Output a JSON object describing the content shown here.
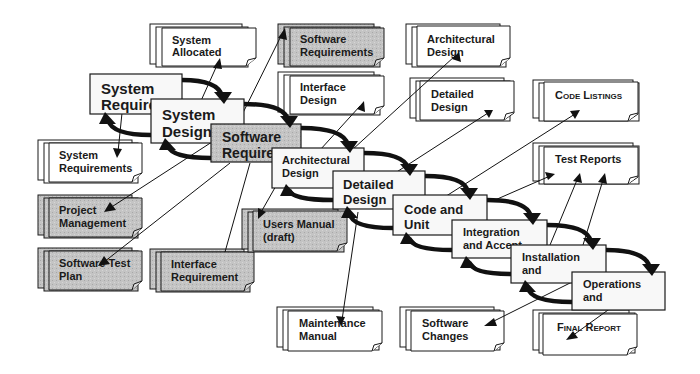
{
  "diagram": {
    "colors": {
      "background": "#ffffff",
      "phase_fill_white": "#f8f8f8",
      "phase_fill_gray": "#bdbdbd",
      "doc_fill_white": "#ffffff",
      "doc_fill_gray": "#c2c2c2",
      "stroke": "#1a1a1a"
    },
    "phases": [
      {
        "id": "system-requirements",
        "lines": [
          "System",
          "Require"
        ],
        "shaded": false
      },
      {
        "id": "system-design",
        "lines": [
          "System",
          "Design"
        ],
        "shaded": false
      },
      {
        "id": "software-requirements",
        "lines": [
          "Software",
          "Require"
        ],
        "shaded": true
      },
      {
        "id": "architectural-design",
        "lines": [
          "Architectural",
          "Design"
        ],
        "shaded": false
      },
      {
        "id": "detailed-design",
        "lines": [
          "Detailed",
          "Design"
        ],
        "shaded": false
      },
      {
        "id": "code-and-unit",
        "lines": [
          "Code and",
          "Unit"
        ],
        "shaded": false
      },
      {
        "id": "integration-and-acceptance",
        "lines": [
          "Integration",
          "and Accept"
        ],
        "shaded": false
      },
      {
        "id": "installation",
        "lines": [
          "Installation",
          "and"
        ],
        "shaded": false
      },
      {
        "id": "operations",
        "lines": [
          "Operations",
          "and"
        ],
        "shaded": false
      }
    ],
    "documents": [
      {
        "id": "system-allocated",
        "lines": [
          "System",
          "Allocated"
        ],
        "shaded": false
      },
      {
        "id": "software-requirements-doc",
        "lines": [
          "Software",
          "Requirements"
        ],
        "shaded": true
      },
      {
        "id": "interface-design",
        "lines": [
          "Interface",
          "Design"
        ],
        "shaded": false
      },
      {
        "id": "architectural-design-doc",
        "lines": [
          "Architectural",
          "Design"
        ],
        "shaded": false
      },
      {
        "id": "detailed-design-doc",
        "lines": [
          "Detailed",
          "Design"
        ],
        "shaded": false
      },
      {
        "id": "code-listings",
        "lines": [
          "Code Listings"
        ],
        "shaded": false,
        "small_caps": true
      },
      {
        "id": "test-reports",
        "lines": [
          "Test Reports"
        ],
        "shaded": false
      },
      {
        "id": "system-requirements-doc",
        "lines": [
          "System",
          "Requirements"
        ],
        "shaded": false
      },
      {
        "id": "project-management",
        "lines": [
          "Project",
          "Management"
        ],
        "shaded": true
      },
      {
        "id": "software-test-plan",
        "lines": [
          "Software Test",
          "Plan"
        ],
        "shaded": true
      },
      {
        "id": "interface-requirement",
        "lines": [
          "Interface",
          "Requirement"
        ],
        "shaded": true
      },
      {
        "id": "users-manual-draft",
        "lines": [
          "Users Manual",
          "(draft)"
        ],
        "shaded": true
      },
      {
        "id": "maintenance-manual",
        "lines": [
          "Maintenance",
          "Manual"
        ],
        "shaded": false
      },
      {
        "id": "software-changes",
        "lines": [
          "Software",
          "Changes"
        ],
        "shaded": false
      },
      {
        "id": "final-report",
        "lines": [
          "Final Report"
        ],
        "shaded": false,
        "small_caps": true
      }
    ]
  }
}
